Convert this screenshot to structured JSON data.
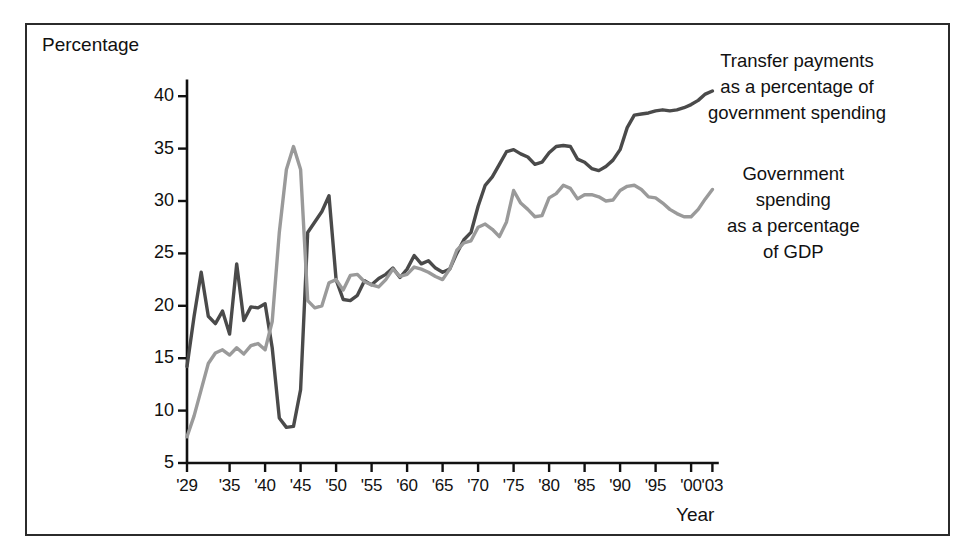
{
  "figure": {
    "background_color": "#ffffff",
    "frame_color": "#2b2b2b"
  },
  "axis_titles": {
    "y": "Percentage",
    "x": "Year"
  },
  "legend": {
    "transfer": "Transfer payments\nas a percentage of\ngovernment spending",
    "transfer_lines": [
      "Transfer payments",
      "as a percentage of",
      "government spending"
    ],
    "spending_lines": [
      "Government",
      "spending",
      "as a percentage",
      "of GDP"
    ]
  },
  "chart_data": {
    "type": "line",
    "title": "",
    "subtitle": "",
    "xlabel": "Year",
    "ylabel": "Percentage",
    "xlim": [
      1929,
      2003
    ],
    "ylim": [
      5,
      41
    ],
    "grid": false,
    "legend_position": "right-inline-annotations",
    "y_ticks": [
      5,
      10,
      15,
      20,
      25,
      30,
      35,
      40
    ],
    "y_tick_labels": [
      "5",
      "10",
      "15",
      "20",
      "25",
      "30",
      "35",
      "40"
    ],
    "x_ticks": [
      1929,
      1935,
      1940,
      1945,
      1950,
      1955,
      1960,
      1965,
      1970,
      1975,
      1980,
      1985,
      1990,
      1995,
      2000,
      2003
    ],
    "x_tick_labels": [
      "'29",
      "'35",
      "'40",
      "'45",
      "'50",
      "'55",
      "'60",
      "'65",
      "'70",
      "'75",
      "'80",
      "'85",
      "'90",
      "'95",
      "'00",
      "'03"
    ],
    "colors": {
      "transfer_payments": "#4a4a4a",
      "government_spending": "#9a9a9a"
    },
    "series": [
      {
        "name": "Transfer payments as a percentage of government spending",
        "color": "#4a4a4a",
        "x": [
          1929,
          1930,
          1931,
          1932,
          1933,
          1934,
          1935,
          1936,
          1937,
          1938,
          1939,
          1940,
          1941,
          1942,
          1943,
          1944,
          1945,
          1946,
          1947,
          1948,
          1949,
          1950,
          1951,
          1952,
          1953,
          1954,
          1955,
          1956,
          1957,
          1958,
          1959,
          1960,
          1961,
          1962,
          1963,
          1964,
          1965,
          1966,
          1967,
          1968,
          1969,
          1970,
          1971,
          1972,
          1973,
          1974,
          1975,
          1976,
          1977,
          1978,
          1979,
          1980,
          1981,
          1982,
          1983,
          1984,
          1985,
          1986,
          1987,
          1988,
          1989,
          1990,
          1991,
          1992,
          1993,
          1994,
          1995,
          1996,
          1997,
          1998,
          1999,
          2000,
          2001,
          2002,
          2003
        ],
        "values": [
          14.2,
          19.0,
          23.2,
          19.0,
          18.3,
          19.5,
          17.3,
          24.0,
          18.6,
          19.9,
          19.8,
          20.2,
          16.0,
          9.3,
          8.4,
          8.5,
          12.0,
          27.0,
          28.0,
          29.0,
          30.5,
          22.5,
          20.6,
          20.5,
          21.0,
          22.4,
          22.0,
          22.6,
          23.0,
          23.6,
          22.7,
          23.5,
          24.8,
          24.0,
          24.3,
          23.6,
          23.2,
          23.5,
          25.0,
          26.3,
          27.0,
          29.5,
          31.5,
          32.3,
          33.5,
          34.7,
          34.9,
          34.5,
          34.2,
          33.5,
          33.7,
          34.6,
          35.2,
          35.3,
          35.2,
          34.0,
          33.7,
          33.1,
          32.9,
          33.3,
          33.9,
          34.9,
          37.0,
          38.2,
          38.3,
          38.4,
          38.6,
          38.7,
          38.6,
          38.7,
          38.9,
          39.2,
          39.6,
          40.2,
          40.5
        ]
      },
      {
        "name": "Government spending as a percentage of GDP",
        "color": "#9a9a9a",
        "x": [
          1929,
          1930,
          1931,
          1932,
          1933,
          1934,
          1935,
          1936,
          1937,
          1938,
          1939,
          1940,
          1941,
          1942,
          1943,
          1944,
          1945,
          1946,
          1947,
          1948,
          1949,
          1950,
          1951,
          1952,
          1953,
          1954,
          1955,
          1956,
          1957,
          1958,
          1959,
          1960,
          1961,
          1962,
          1963,
          1964,
          1965,
          1966,
          1967,
          1968,
          1969,
          1970,
          1971,
          1972,
          1973,
          1974,
          1975,
          1976,
          1977,
          1978,
          1979,
          1980,
          1981,
          1982,
          1983,
          1984,
          1985,
          1986,
          1987,
          1988,
          1989,
          1990,
          1991,
          1992,
          1993,
          1994,
          1995,
          1996,
          1997,
          1998,
          1999,
          2000,
          2001,
          2002,
          2003
        ],
        "values": [
          7.5,
          9.5,
          12.0,
          14.5,
          15.5,
          15.8,
          15.3,
          16.0,
          15.4,
          16.2,
          16.4,
          15.8,
          18.5,
          27.0,
          33.0,
          35.2,
          33.0,
          20.5,
          19.8,
          20.0,
          22.2,
          22.5,
          21.5,
          22.9,
          23.0,
          22.3,
          22.0,
          21.8,
          22.5,
          23.5,
          22.8,
          23.0,
          23.7,
          23.5,
          23.2,
          22.8,
          22.5,
          23.5,
          25.3,
          26.0,
          26.2,
          27.5,
          27.8,
          27.3,
          26.6,
          28.0,
          31.0,
          29.8,
          29.2,
          28.5,
          28.6,
          30.3,
          30.7,
          31.5,
          31.2,
          30.2,
          30.6,
          30.6,
          30.4,
          30.0,
          30.1,
          31.0,
          31.4,
          31.5,
          31.1,
          30.4,
          30.3,
          29.8,
          29.2,
          28.8,
          28.5,
          28.5,
          29.2,
          30.2,
          31.1
        ]
      }
    ]
  }
}
